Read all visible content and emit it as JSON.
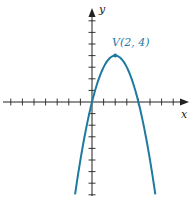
{
  "chart_data": {
    "type": "line",
    "title": "",
    "function": "y = -(x-2)^2 + 4",
    "xlabel": "x",
    "ylabel": "y",
    "xlim": [
      -8,
      7.8
    ],
    "ylim": [
      -8,
      7.6
    ],
    "grid": false,
    "x_ticks": [
      -7,
      -6,
      -5,
      -4,
      -3,
      -2,
      -1,
      1,
      2,
      3,
      4,
      5,
      6,
      7
    ],
    "y_ticks": [
      -8,
      -7,
      -6,
      -5,
      -4,
      -3,
      -2,
      -1,
      1,
      2,
      3,
      4,
      5,
      6,
      7
    ],
    "tick_labels_shown": false,
    "series": [
      {
        "name": "parabola",
        "color": "#1f7aa0",
        "x": [
          -1.46,
          -1,
          0,
          1,
          2,
          3,
          4,
          5,
          5.46
        ],
        "y": [
          -8,
          -5,
          0,
          3,
          4,
          3,
          0,
          -5,
          -8
        ]
      }
    ],
    "annotations": [
      {
        "text": "V(2, 4)",
        "x": 2,
        "y": 4,
        "color": "#1f7aa0",
        "marker": "dot"
      }
    ]
  },
  "labels": {
    "x_axis": "x",
    "y_axis": "y",
    "vertex": "V(2, 4)"
  },
  "colors": {
    "curve": "#1f7aa0",
    "axes": "#222222"
  }
}
